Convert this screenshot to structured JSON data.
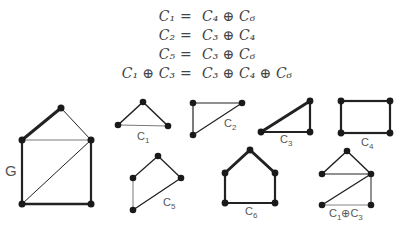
{
  "equations": [
    {
      "lhs": "C₁",
      "op": "=",
      "rhs": "C₄ ⊕ C₆"
    },
    {
      "lhs": "C₂",
      "op": "=",
      "rhs": "C₃ ⊕ C₄"
    },
    {
      "lhs": "C₅",
      "op": "=",
      "rhs": "C₃ ⊕ C₆"
    },
    {
      "lhs": "C₁ ⊕ C₃",
      "op": "=",
      "rhs": "C₃ ⊕ C₄ ⊕ C₆"
    }
  ],
  "graphs": {
    "G": {
      "label": "G"
    },
    "c1": {
      "label": "C",
      "sub": "1"
    },
    "c2": {
      "label": "C",
      "sub": "2"
    },
    "c3": {
      "label": "C",
      "sub": "3"
    },
    "c4": {
      "label": "C",
      "sub": "4"
    },
    "c5": {
      "label": "C",
      "sub": "5"
    },
    "c6": {
      "label": "C",
      "sub": "6"
    },
    "c1c3": {
      "label_a": "C",
      "sub_a": "1",
      "op": "⊕",
      "label_b": "C",
      "sub_b": "3"
    }
  },
  "colors": {
    "edge": "#222222",
    "vertex": "#1a1a1a",
    "text": "#555555"
  }
}
